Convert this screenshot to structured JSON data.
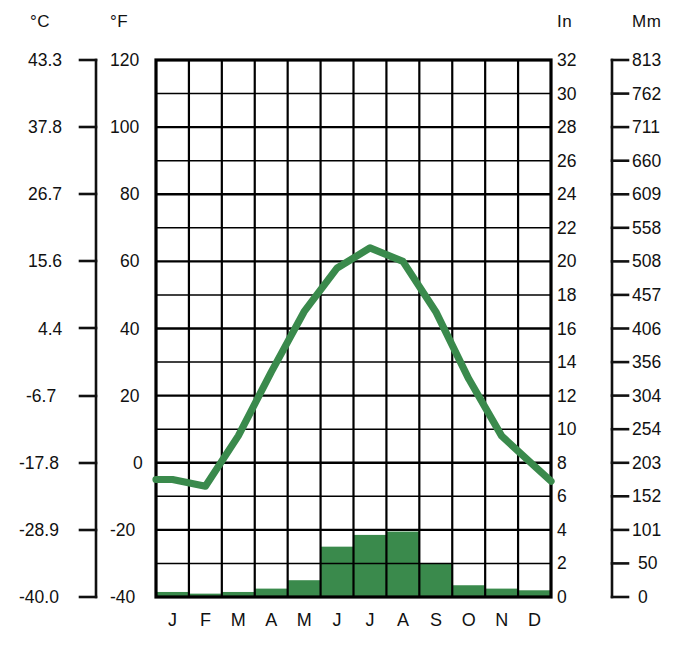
{
  "figure": {
    "type": "climograph",
    "title": ""
  },
  "axes": {
    "celsius": {
      "unit_label": "°C",
      "ticks": [
        "43.3",
        "37.8",
        "26.7",
        "15.6",
        "4.4",
        "-6.7",
        "-17.8",
        "-28.9",
        "-40.0"
      ],
      "tick_values": [
        43.3,
        37.8,
        26.7,
        15.6,
        4.4,
        -6.7,
        -17.8,
        -28.9,
        -40.0
      ]
    },
    "fahrenheit": {
      "unit_label": "°F",
      "ticks": [
        "120",
        "100",
        "80",
        "60",
        "40",
        "20",
        "0",
        "-20",
        "-40"
      ],
      "tick_values": [
        120,
        100,
        80,
        60,
        40,
        20,
        0,
        -20,
        -40
      ]
    },
    "inches": {
      "unit_label": "In",
      "ticks": [
        "32",
        "30",
        "28",
        "26",
        "24",
        "22",
        "20",
        "18",
        "16",
        "14",
        "12",
        "10",
        "8",
        "6",
        "4",
        "2",
        "0"
      ],
      "tick_values": [
        32,
        30,
        28,
        26,
        24,
        22,
        20,
        18,
        16,
        14,
        12,
        10,
        8,
        6,
        4,
        2,
        0
      ]
    },
    "millimeters": {
      "unit_label": "Mm",
      "ticks": [
        "813",
        "762",
        "711",
        "660",
        "609",
        "558",
        "508",
        "457",
        "406",
        "356",
        "304",
        "254",
        "203",
        "152",
        "101",
        "50",
        "0"
      ],
      "tick_values": [
        813,
        762,
        711,
        660,
        609,
        558,
        508,
        457,
        406,
        356,
        304,
        254,
        203,
        152,
        101,
        50,
        0
      ]
    }
  },
  "colors": {
    "series_green": "#3a8a4c",
    "grid": "#000000",
    "text": "#111111",
    "background": "#ffffff"
  },
  "chart_data": {
    "type": "line",
    "title": "",
    "xlabel": "",
    "ylabel": "",
    "grid": true,
    "legend_position": "none",
    "categories": [
      "J",
      "F",
      "M",
      "A",
      "M",
      "J",
      "J",
      "A",
      "S",
      "O",
      "N",
      "D"
    ],
    "month_labels": [
      "J",
      "F",
      "M",
      "A",
      "M",
      "J",
      "J",
      "A",
      "S",
      "O",
      "N",
      "D"
    ],
    "axis_ranges": {
      "temperature_f": [
        -40,
        120
      ],
      "temperature_c": [
        -40.0,
        43.3
      ],
      "precipitation_in": [
        0,
        32
      ],
      "precipitation_mm": [
        0,
        813
      ]
    },
    "series": [
      {
        "name": "Temperature",
        "type": "line",
        "unit": "°F",
        "color": "#3a8a4c",
        "values": [
          -5,
          -7,
          8,
          27,
          45,
          58,
          64,
          60,
          45,
          25,
          8,
          -1
        ]
      },
      {
        "name": "Precipitation",
        "type": "bar",
        "unit": "in",
        "color": "#3a8a4c",
        "values": [
          0.3,
          0.2,
          0.3,
          0.5,
          1.0,
          3.0,
          3.7,
          3.9,
          2.0,
          0.7,
          0.5,
          0.4
        ]
      }
    ]
  }
}
